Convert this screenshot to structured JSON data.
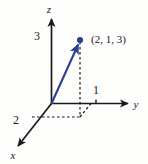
{
  "figure": {
    "background_color": "#fdfdfc",
    "axis_color": "#1a1a1a",
    "vector_color": "#2a3f8f",
    "point_color": "#2a3f8f",
    "dashed_color": "#1a1a1a"
  },
  "axes": {
    "x": {
      "label": "x",
      "direction": "down-left"
    },
    "y": {
      "label": "y",
      "direction": "right"
    },
    "z": {
      "label": "z",
      "direction": "up"
    }
  },
  "ticks": {
    "x_value": "2",
    "y_value": "1",
    "z_value": "3"
  },
  "point": {
    "label": "(2, 1, 3)",
    "coordinates": [
      2,
      1,
      3
    ]
  }
}
